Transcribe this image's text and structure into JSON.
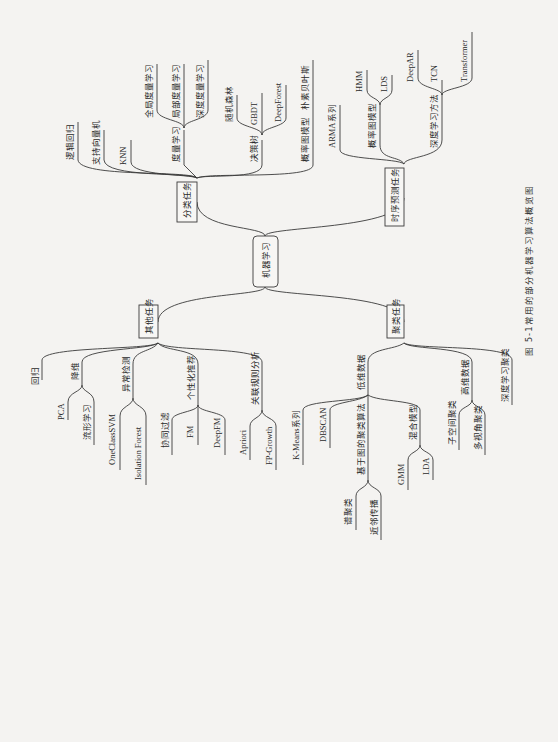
{
  "root": "机器学习",
  "caption": {
    "number": "图 5-1",
    "title": "常用的部分机器学习算法概览图"
  },
  "classification": {
    "label": "分类任务",
    "items": {
      "lr": "逻辑回归",
      "svm": "支持向量机",
      "knn": "KNN",
      "metric": "度量学习",
      "metric_global": "全局度量学习",
      "metric_local": "局部度量学习",
      "metric_deep": "深度度量学习",
      "tree": "决策树",
      "rf": "随机森林",
      "gbdt": "GBDT",
      "deepforest": "DeepForest",
      "pgm": "概率图模型",
      "nb": "朴素贝叶斯"
    }
  },
  "timeseries": {
    "label": "时序预测任务",
    "items": {
      "arma": "ARMA系列",
      "pgm": "概率图模型",
      "hmm": "HMM",
      "lds": "LDS",
      "dl": "深度学习方法",
      "deepar": "DeepAR",
      "tcn": "TCN",
      "transformer": "Transformer"
    }
  },
  "other": {
    "label": "其他任务",
    "items": {
      "regression": "回归",
      "dimred": "降维",
      "pca": "PCA",
      "manifold": "流形学习",
      "anomaly": "异常检测",
      "ocsvm": "OneClassSVM",
      "iforest": "Isolation Forest",
      "recsys": "个性化推荐",
      "cf": "协同过滤",
      "fm": "FM",
      "deepfm": "DeepFM",
      "assoc": "关联规则分析",
      "apriori": "Apriori",
      "fpgrowth": "FP-Growth"
    }
  },
  "clustering": {
    "label": "聚类任务",
    "items": {
      "lowdim": "低维数据",
      "kmeans": "K-Means系列",
      "dbscan": "DBSCAN",
      "graph": "基于图的聚类算法",
      "spectral": "谱聚类",
      "affinity": "近邻传播",
      "mixture": "混合模型",
      "gmm": "GMM",
      "lda": "LDA",
      "highdim": "高维数据",
      "subspace": "子空间聚类",
      "multiview": "多视角聚类",
      "deep": "深度学习聚类"
    }
  }
}
